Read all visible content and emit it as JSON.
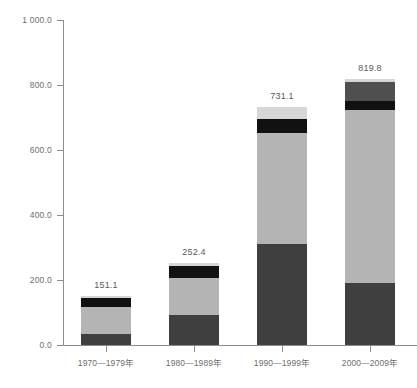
{
  "chart_data": {
    "type": "bar",
    "subtype": "stacked-bar",
    "title": "",
    "subtitle": "",
    "xlabel": "",
    "ylabel": "",
    "ylim": [
      0,
      1000
    ],
    "grid": false,
    "legend": "none",
    "categories": [
      "1970—1979年",
      "1980—1989年",
      "1990—1999年",
      "2000—2009年"
    ],
    "totals": [
      151.1,
      252.4,
      731.1,
      819.8
    ],
    "total_labels": [
      "151.1",
      "252.4",
      "731.1",
      "819.8"
    ],
    "ytick_values": [
      0,
      200,
      400,
      600,
      800,
      1000
    ],
    "ytick_labels": [
      "0.0",
      "200.0",
      "400.0",
      "600.0",
      "800.0",
      "1 000.0"
    ],
    "series": [
      {
        "name": "segment-1-bottom",
        "color": "#3f3f3f",
        "values": [
          33.0,
          93.0,
          311.0,
          192.0
        ]
      },
      {
        "name": "segment-2-middle",
        "color": "#b4b4b4",
        "values": [
          83.0,
          113.0,
          340.0,
          532.0
        ]
      },
      {
        "name": "segment-3-black",
        "color": "#111111",
        "values": [
          30.0,
          38.0,
          44.0,
          28.0
        ]
      },
      {
        "name": "segment-4-darkgray",
        "color": "#4f4f4f",
        "values": [
          0.0,
          0.0,
          0.0,
          58.0
        ]
      },
      {
        "name": "segment-5-top",
        "color": "#d6d6d6",
        "values": [
          5.1,
          8.4,
          36.1,
          9.8
        ]
      }
    ]
  },
  "axes": {
    "y_axis_name": "y-axis",
    "x_axis_name": "x-axis"
  }
}
